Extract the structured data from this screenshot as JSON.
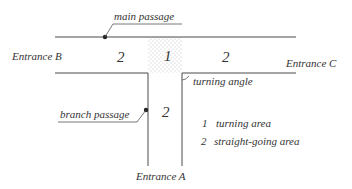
{
  "labels": {
    "main_passage": "main passage",
    "branch_passage": "branch passage",
    "entrance_a": "Entrance A",
    "entrance_b": "Entrance B",
    "entrance_c": "Entrance C",
    "turning_angle": "turning angle"
  },
  "areas": {
    "left_straight": "2",
    "turning": "1",
    "right_straight": "2",
    "branch_straight": "2"
  },
  "legend": [
    {
      "num": "1",
      "text": "turning area"
    },
    {
      "num": "2",
      "text": "straight-going area"
    }
  ],
  "colors": {
    "line": "#4a4a4a",
    "text": "#333333",
    "dot_fill": "#b8b8b8"
  }
}
